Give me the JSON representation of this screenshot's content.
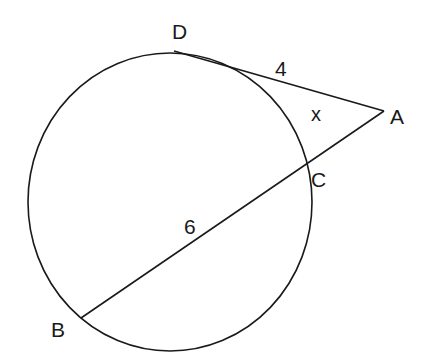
{
  "diagram": {
    "type": "circle with tangent and secant from external point",
    "points": {
      "A": {
        "label": "A"
      },
      "B": {
        "label": "B"
      },
      "C": {
        "label": "C"
      },
      "D": {
        "label": "D"
      }
    },
    "segments": {
      "AD": {
        "label": "4",
        "kind": "tangent"
      },
      "CA": {
        "label": "x",
        "kind": "external secant segment"
      },
      "BC": {
        "label": "6",
        "kind": "chord / internal secant segment"
      }
    },
    "colors": {
      "stroke": "#1a1a1a",
      "background": "#ffffff"
    }
  }
}
